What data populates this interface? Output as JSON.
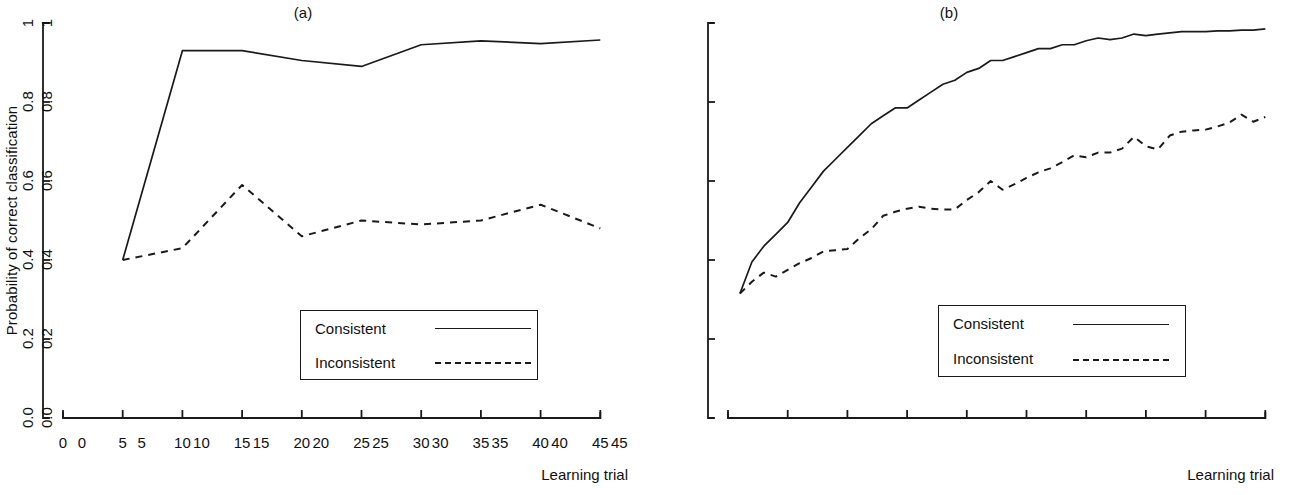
{
  "figure": {
    "background": "#ffffff",
    "line_color": "#1a1a1a"
  },
  "panels": [
    {
      "id": "a",
      "title": "(a)",
      "xlabel": "Learning trial",
      "ylabel": "Probability of correct classification",
      "legend": {
        "consistent": "Consistent",
        "inconsistent": "Inconsistent"
      },
      "xticks": [
        "0",
        "5",
        "10",
        "15",
        "20",
        "25",
        "30",
        "35",
        "40",
        "45"
      ],
      "yticks": [
        "0.0",
        "0.2",
        "0.4",
        "0.6",
        "0.8",
        "1"
      ]
    },
    {
      "id": "b",
      "title": "(b)",
      "xlabel": "Learning trial",
      "ylabel": "Probability of correct classification",
      "legend": {
        "consistent": "Consistent",
        "inconsistent": "Inconsistent"
      },
      "xticks": [
        "0",
        "5",
        "10",
        "15",
        "20",
        "25",
        "30",
        "35",
        "40",
        "45"
      ],
      "yticks": [
        "0.0",
        "0.2",
        "0.4",
        "0.6",
        "0.8",
        "1"
      ]
    }
  ],
  "chart_data": [
    {
      "type": "line",
      "title": "(a)",
      "xlabel": "Learning trial",
      "ylabel": "Probability of correct classification",
      "xlim": [
        0,
        45
      ],
      "ylim": [
        0.0,
        1.0
      ],
      "xticks": [
        0,
        5,
        10,
        15,
        20,
        25,
        30,
        35,
        40,
        45
      ],
      "yticks": [
        0.0,
        0.2,
        0.4,
        0.6,
        0.8,
        1.0
      ],
      "grid": false,
      "legend_position": "lower-right",
      "series": [
        {
          "name": "Consistent",
          "style": "solid",
          "x": [
            5,
            10,
            15,
            20,
            25,
            30,
            35,
            40,
            45
          ],
          "values": [
            0.4,
            0.93,
            0.93,
            0.905,
            0.89,
            0.945,
            0.955,
            0.948,
            0.957
          ]
        },
        {
          "name": "Inconsistent",
          "style": "dashed",
          "x": [
            5,
            10,
            15,
            20,
            25,
            30,
            35,
            40,
            45
          ],
          "values": [
            0.4,
            0.43,
            0.59,
            0.46,
            0.5,
            0.49,
            0.5,
            0.54,
            0.48
          ]
        }
      ]
    },
    {
      "type": "line",
      "title": "(b)",
      "xlabel": "Learning trial",
      "ylabel": "Probability of correct classification",
      "xlim": [
        0,
        45
      ],
      "ylim": [
        0.0,
        1.0
      ],
      "xticks": [
        0,
        5,
        10,
        15,
        20,
        25,
        30,
        35,
        40,
        45
      ],
      "yticks": [
        0.0,
        0.2,
        0.4,
        0.6,
        0.8,
        1.0
      ],
      "grid": false,
      "legend_position": "lower-right",
      "series": [
        {
          "name": "Consistent",
          "style": "solid",
          "x": [
            1,
            2,
            3,
            4,
            5,
            6,
            7,
            8,
            9,
            10,
            11,
            12,
            13,
            14,
            15,
            16,
            17,
            18,
            19,
            20,
            21,
            22,
            23,
            24,
            25,
            26,
            27,
            28,
            29,
            30,
            31,
            32,
            33,
            34,
            35,
            36,
            37,
            38,
            39,
            40,
            41,
            42,
            43,
            44,
            45
          ],
          "values": [
            0.315,
            0.395,
            0.435,
            0.465,
            0.495,
            0.545,
            0.585,
            0.625,
            0.655,
            0.685,
            0.715,
            0.745,
            0.765,
            0.785,
            0.785,
            0.805,
            0.825,
            0.845,
            0.855,
            0.875,
            0.885,
            0.905,
            0.905,
            0.915,
            0.925,
            0.935,
            0.935,
            0.945,
            0.945,
            0.955,
            0.962,
            0.958,
            0.962,
            0.972,
            0.968,
            0.972,
            0.975,
            0.978,
            0.978,
            0.978,
            0.98,
            0.98,
            0.982,
            0.982,
            0.985
          ]
        },
        {
          "name": "Inconsistent",
          "style": "dashed",
          "x": [
            1,
            2,
            3,
            4,
            5,
            6,
            7,
            8,
            9,
            10,
            11,
            12,
            13,
            14,
            15,
            16,
            17,
            18,
            19,
            20,
            21,
            22,
            23,
            24,
            25,
            26,
            27,
            28,
            29,
            30,
            31,
            32,
            33,
            34,
            35,
            36,
            37,
            38,
            39,
            40,
            41,
            42,
            43,
            44,
            45
          ],
          "values": [
            0.315,
            0.345,
            0.368,
            0.358,
            0.375,
            0.392,
            0.405,
            0.422,
            0.425,
            0.428,
            0.455,
            0.478,
            0.512,
            0.522,
            0.53,
            0.535,
            0.53,
            0.528,
            0.528,
            0.552,
            0.572,
            0.6,
            0.578,
            0.592,
            0.608,
            0.622,
            0.632,
            0.648,
            0.665,
            0.66,
            0.672,
            0.672,
            0.682,
            0.712,
            0.688,
            0.68,
            0.715,
            0.725,
            0.728,
            0.73,
            0.738,
            0.748,
            0.768,
            0.75,
            0.762
          ]
        }
      ]
    }
  ]
}
